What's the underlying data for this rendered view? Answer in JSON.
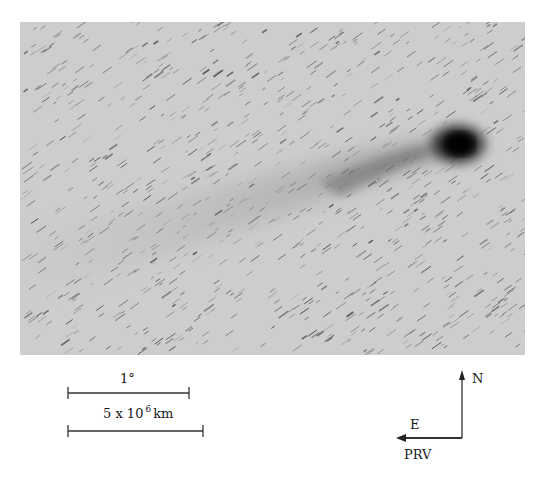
{
  "figure": {
    "colors": {
      "sky": "#cfcfcf",
      "nucleus": "#0a0a0a",
      "stars": "#555555"
    }
  },
  "scale_bars": [
    {
      "label": "1°",
      "x1": 68,
      "x2": 189,
      "y": 393
    },
    {
      "label_base": "5 x 10",
      "label_exp": "6",
      "label_unit": "km",
      "x1": 68,
      "x2": 203,
      "y": 431
    }
  ],
  "compass": {
    "north_label": "N",
    "east_label": "E",
    "prv_label": "PRV"
  }
}
